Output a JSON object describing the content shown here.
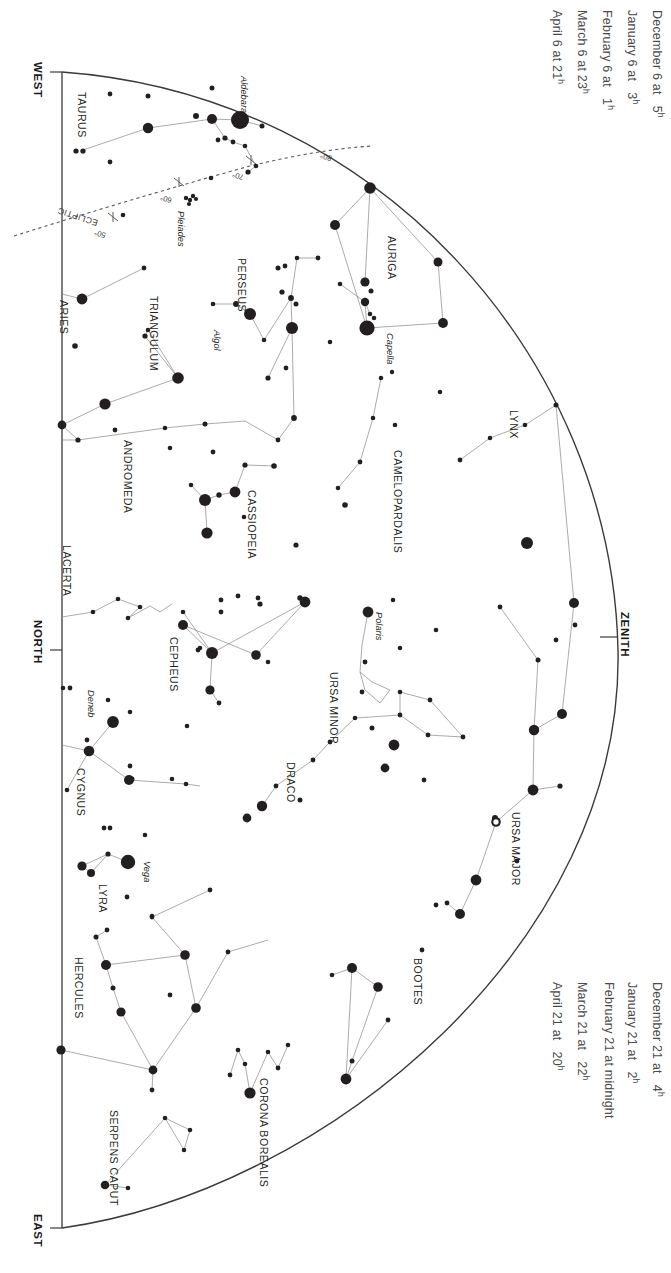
{
  "captions": {
    "top": {
      "name": "top-date-table",
      "rows": [
        {
          "date": "December 6 at",
          "time": "5",
          "unit": "h"
        },
        {
          "date": "January 6 at",
          "time": "3",
          "unit": "h"
        },
        {
          "date": "February 6 at",
          "time": "1",
          "unit": "h"
        },
        {
          "date": "March 6 at 23",
          "time": "",
          "unit": "h"
        },
        {
          "date": "April 6 at 21",
          "time": "",
          "unit": "h"
        }
      ]
    },
    "bottom": {
      "name": "bottom-date-table",
      "rows": [
        {
          "date": "December 21 at",
          "time": "4",
          "unit": "h"
        },
        {
          "date": "January 21 at",
          "time": "2",
          "unit": "h"
        },
        {
          "date": "February 21 at midnight",
          "time": "",
          "unit": ""
        },
        {
          "date": "March 21 at",
          "time": "22",
          "unit": "h"
        },
        {
          "date": "April 21 at",
          "time": "20",
          "unit": "h"
        }
      ]
    }
  },
  "directions": [
    {
      "label": "WEST",
      "x": 38,
      "y": 73
    },
    {
      "label": "NORTH",
      "x": 38,
      "y": 632
    },
    {
      "label": "EAST",
      "x": 38,
      "y": 1228
    },
    {
      "label": "ZENITH",
      "x": 631,
      "y": 624
    }
  ],
  "ecliptic": {
    "label": "ECLIPTIC",
    "degrees": [
      "50°",
      "60°",
      "70°",
      "80°"
    ]
  },
  "constellations": [
    {
      "name": "TAURUS",
      "x": 88,
      "y": 92
    },
    {
      "name": "ARIES",
      "x": 70,
      "y": 300
    },
    {
      "name": "TRIANGULUM",
      "x": 160,
      "y": 296
    },
    {
      "name": "PERSEUS",
      "x": 248,
      "y": 258
    },
    {
      "name": "ANDROMEDA",
      "x": 134,
      "y": 440
    },
    {
      "name": "CASSIOPEIA",
      "x": 258,
      "y": 490
    },
    {
      "name": "AURIGA",
      "x": 398,
      "y": 236
    },
    {
      "name": "CAMELOPARDALIS",
      "x": 404,
      "y": 450
    },
    {
      "name": "LYNX",
      "x": 520,
      "y": 410
    },
    {
      "name": "LACERTA",
      "x": 73,
      "y": 545
    },
    {
      "name": "CEPHEUS",
      "x": 180,
      "y": 637
    },
    {
      "name": "CYGNUS",
      "x": 87,
      "y": 768
    },
    {
      "name": "DRACO",
      "x": 297,
      "y": 762
    },
    {
      "name": "URSA MINOR",
      "x": 340,
      "y": 672
    },
    {
      "name": "URSA MAJOR",
      "x": 522,
      "y": 812
    },
    {
      "name": "LYRA",
      "x": 109,
      "y": 884
    },
    {
      "name": "HERCULES",
      "x": 85,
      "y": 957
    },
    {
      "name": "BOOTES",
      "x": 424,
      "y": 958
    },
    {
      "name": "CORONA BOREALIS",
      "x": 270,
      "y": 1078
    },
    {
      "name": "SERPENS CAPUT",
      "x": 120,
      "y": 1110
    }
  ],
  "named_stars": [
    {
      "name": "Aldebaran",
      "x": 249,
      "y": 76
    },
    {
      "name": "Capella",
      "x": 395,
      "y": 333
    },
    {
      "name": "Algol",
      "x": 222,
      "y": 330
    },
    {
      "name": "Polaris",
      "x": 384,
      "y": 612
    },
    {
      "name": "Deneb",
      "x": 96,
      "y": 690
    },
    {
      "name": "Vega",
      "x": 152,
      "y": 861
    },
    {
      "name": "Pleiades",
      "x": 186,
      "y": 211
    }
  ],
  "colors": {
    "ink": "#231f20",
    "caption": "#4a4a4a",
    "horizon": "#3a3a3a",
    "constellation_line": "#8a8a8a",
    "ecliptic": "#5a5a5a"
  },
  "chart_data": {
    "type": "scatter",
    "xlabel": "",
    "ylabel": "",
    "projection": "half-dome horizon with zenith at right",
    "magnitude_sizes": {
      "m1": 9,
      "m2": 6.5,
      "m3": 4.6,
      "m4": 3.2,
      "m5": 2.2
    },
    "stars": [
      {
        "x": 240,
        "y": 120,
        "r": 9.0
      },
      {
        "x": 212,
        "y": 119,
        "r": 5.0
      },
      {
        "x": 196,
        "y": 116,
        "r": 3.0
      },
      {
        "x": 110,
        "y": 94,
        "r": 2.4
      },
      {
        "x": 148,
        "y": 96,
        "r": 2.5
      },
      {
        "x": 148,
        "y": 128,
        "r": 5.2
      },
      {
        "x": 76,
        "y": 151,
        "r": 2.6
      },
      {
        "x": 83,
        "y": 151,
        "r": 2.6
      },
      {
        "x": 110,
        "y": 162,
        "r": 2.4
      },
      {
        "x": 212,
        "y": 88,
        "r": 2.5
      },
      {
        "x": 225,
        "y": 138,
        "r": 2.6
      },
      {
        "x": 218,
        "y": 140,
        "r": 2.4
      },
      {
        "x": 233,
        "y": 142,
        "r": 2.4
      },
      {
        "x": 245,
        "y": 146,
        "r": 2.3
      },
      {
        "x": 262,
        "y": 126,
        "r": 2.5
      },
      {
        "x": 256,
        "y": 166,
        "r": 2.3
      },
      {
        "x": 248,
        "y": 172,
        "r": 2.6
      },
      {
        "x": 211,
        "y": 178,
        "r": 2.3
      },
      {
        "x": 123,
        "y": 215,
        "r": 2.3
      },
      {
        "x": 186,
        "y": 198,
        "r": 2.2
      },
      {
        "x": 190,
        "y": 200,
        "r": 2.2
      },
      {
        "x": 193,
        "y": 196,
        "r": 2.2
      },
      {
        "x": 196,
        "y": 199,
        "r": 2.1
      },
      {
        "x": 189,
        "y": 204,
        "r": 2.1
      },
      {
        "x": 144,
        "y": 268,
        "r": 2.4
      },
      {
        "x": 82,
        "y": 299,
        "r": 5.4
      },
      {
        "x": 75,
        "y": 346,
        "r": 2.8
      },
      {
        "x": 145,
        "y": 336,
        "r": 2.6
      },
      {
        "x": 148,
        "y": 330,
        "r": 2.3
      },
      {
        "x": 178,
        "y": 378,
        "r": 5.8
      },
      {
        "x": 105,
        "y": 404,
        "r": 5.6
      },
      {
        "x": 62,
        "y": 425,
        "r": 4.4
      },
      {
        "x": 78,
        "y": 440,
        "r": 2.6
      },
      {
        "x": 115,
        "y": 430,
        "r": 2.4
      },
      {
        "x": 165,
        "y": 428,
        "r": 2.3
      },
      {
        "x": 205,
        "y": 424,
        "r": 2.5
      },
      {
        "x": 170,
        "y": 448,
        "r": 2.3
      },
      {
        "x": 205,
        "y": 500,
        "r": 6.0
      },
      {
        "x": 219,
        "y": 495,
        "r": 2.7
      },
      {
        "x": 235,
        "y": 492,
        "r": 5.4
      },
      {
        "x": 245,
        "y": 465,
        "r": 2.6
      },
      {
        "x": 274,
        "y": 466,
        "r": 2.8
      },
      {
        "x": 207,
        "y": 533,
        "r": 5.6
      },
      {
        "x": 191,
        "y": 485,
        "r": 2.3
      },
      {
        "x": 244,
        "y": 517,
        "r": 2.3
      },
      {
        "x": 213,
        "y": 452,
        "r": 2.4
      },
      {
        "x": 250,
        "y": 314,
        "r": 6.0
      },
      {
        "x": 236,
        "y": 304,
        "r": 2.9
      },
      {
        "x": 213,
        "y": 304,
        "r": 2.3
      },
      {
        "x": 264,
        "y": 340,
        "r": 2.3
      },
      {
        "x": 278,
        "y": 268,
        "r": 2.5
      },
      {
        "x": 282,
        "y": 292,
        "r": 2.6
      },
      {
        "x": 285,
        "y": 266,
        "r": 2.4
      },
      {
        "x": 291,
        "y": 298,
        "r": 2.9
      },
      {
        "x": 296,
        "y": 304,
        "r": 2.5
      },
      {
        "x": 292,
        "y": 328,
        "r": 6.0
      },
      {
        "x": 297,
        "y": 258,
        "r": 2.3
      },
      {
        "x": 268,
        "y": 378,
        "r": 2.6
      },
      {
        "x": 286,
        "y": 368,
        "r": 2.4
      },
      {
        "x": 294,
        "y": 418,
        "r": 2.9
      },
      {
        "x": 278,
        "y": 440,
        "r": 2.4
      },
      {
        "x": 330,
        "y": 342,
        "r": 2.3
      },
      {
        "x": 318,
        "y": 258,
        "r": 2.4
      },
      {
        "x": 370,
        "y": 188,
        "r": 5.8
      },
      {
        "x": 335,
        "y": 225,
        "r": 5.0
      },
      {
        "x": 365,
        "y": 282,
        "r": 4.6
      },
      {
        "x": 370,
        "y": 314,
        "r": 2.3
      },
      {
        "x": 374,
        "y": 318,
        "r": 2.3
      },
      {
        "x": 367,
        "y": 328,
        "r": 7.6
      },
      {
        "x": 438,
        "y": 262,
        "r": 4.5
      },
      {
        "x": 443,
        "y": 323,
        "r": 4.9
      },
      {
        "x": 371,
        "y": 291,
        "r": 2.5
      },
      {
        "x": 365,
        "y": 302,
        "r": 4.2
      },
      {
        "x": 340,
        "y": 284,
        "r": 2.3
      },
      {
        "x": 381,
        "y": 378,
        "r": 2.3
      },
      {
        "x": 440,
        "y": 392,
        "r": 2.3
      },
      {
        "x": 392,
        "y": 372,
        "r": 2.2
      },
      {
        "x": 345,
        "y": 505,
        "r": 2.8
      },
      {
        "x": 373,
        "y": 418,
        "r": 2.3
      },
      {
        "x": 395,
        "y": 425,
        "r": 2.3
      },
      {
        "x": 360,
        "y": 462,
        "r": 2.4
      },
      {
        "x": 338,
        "y": 488,
        "r": 2.3
      },
      {
        "x": 490,
        "y": 438,
        "r": 2.3
      },
      {
        "x": 460,
        "y": 460,
        "r": 2.4
      },
      {
        "x": 525,
        "y": 425,
        "r": 2.3
      },
      {
        "x": 556,
        "y": 405,
        "r": 2.5
      },
      {
        "x": 527,
        "y": 543,
        "r": 6.0
      },
      {
        "x": 296,
        "y": 545,
        "r": 2.6
      },
      {
        "x": 300,
        "y": 598,
        "r": 2.7
      },
      {
        "x": 260,
        "y": 604,
        "r": 2.6
      },
      {
        "x": 221,
        "y": 600,
        "r": 2.4
      },
      {
        "x": 238,
        "y": 596,
        "r": 2.4
      },
      {
        "x": 258,
        "y": 598,
        "r": 2.4
      },
      {
        "x": 140,
        "y": 607,
        "r": 2.3
      },
      {
        "x": 128,
        "y": 618,
        "r": 2.3
      },
      {
        "x": 93,
        "y": 612,
        "r": 2.3
      },
      {
        "x": 118,
        "y": 599,
        "r": 2.3
      },
      {
        "x": 183,
        "y": 625,
        "r": 5.0
      },
      {
        "x": 212,
        "y": 653,
        "r": 6.0
      },
      {
        "x": 210,
        "y": 690,
        "r": 4.6
      },
      {
        "x": 219,
        "y": 703,
        "r": 2.4
      },
      {
        "x": 221,
        "y": 612,
        "r": 2.4
      },
      {
        "x": 183,
        "y": 612,
        "r": 2.3
      },
      {
        "x": 198,
        "y": 650,
        "r": 2.4
      },
      {
        "x": 200,
        "y": 648,
        "r": 2.3
      },
      {
        "x": 256,
        "y": 655,
        "r": 4.8
      },
      {
        "x": 305,
        "y": 602,
        "r": 5.4
      },
      {
        "x": 187,
        "y": 726,
        "r": 2.3
      },
      {
        "x": 130,
        "y": 712,
        "r": 2.3
      },
      {
        "x": 108,
        "y": 700,
        "r": 2.3
      },
      {
        "x": 114,
        "y": 722,
        "r": 2.3
      },
      {
        "x": 87,
        "y": 740,
        "r": 2.4
      },
      {
        "x": 63,
        "y": 688,
        "r": 2.3
      },
      {
        "x": 70,
        "y": 688,
        "r": 2.4
      },
      {
        "x": 113,
        "y": 722,
        "r": 5.9
      },
      {
        "x": 89,
        "y": 751,
        "r": 5.3
      },
      {
        "x": 132,
        "y": 779,
        "r": 2.5
      },
      {
        "x": 130,
        "y": 766,
        "r": 2.4
      },
      {
        "x": 129,
        "y": 780,
        "r": 5.0
      },
      {
        "x": 172,
        "y": 779,
        "r": 2.3
      },
      {
        "x": 186,
        "y": 784,
        "r": 2.3
      },
      {
        "x": 67,
        "y": 790,
        "r": 2.3
      },
      {
        "x": 104,
        "y": 828,
        "r": 2.4
      },
      {
        "x": 110,
        "y": 828,
        "r": 2.4
      },
      {
        "x": 145,
        "y": 835,
        "r": 2.3
      },
      {
        "x": 128,
        "y": 862,
        "r": 7.2
      },
      {
        "x": 82,
        "y": 866,
        "r": 4.6
      },
      {
        "x": 91,
        "y": 873,
        "r": 4.0
      },
      {
        "x": 108,
        "y": 854,
        "r": 2.6
      },
      {
        "x": 127,
        "y": 897,
        "r": 2.4
      },
      {
        "x": 106,
        "y": 965,
        "r": 5.0
      },
      {
        "x": 96,
        "y": 937,
        "r": 2.5
      },
      {
        "x": 107,
        "y": 930,
        "r": 2.4
      },
      {
        "x": 113,
        "y": 988,
        "r": 2.5
      },
      {
        "x": 121,
        "y": 1012,
        "r": 4.6
      },
      {
        "x": 61,
        "y": 1050,
        "r": 4.6
      },
      {
        "x": 153,
        "y": 1070,
        "r": 4.4
      },
      {
        "x": 152,
        "y": 1090,
        "r": 2.4
      },
      {
        "x": 185,
        "y": 955,
        "r": 4.8
      },
      {
        "x": 152,
        "y": 917,
        "r": 2.4
      },
      {
        "x": 196,
        "y": 1008,
        "r": 4.8
      },
      {
        "x": 170,
        "y": 995,
        "r": 2.4
      },
      {
        "x": 210,
        "y": 890,
        "r": 2.4
      },
      {
        "x": 152,
        "y": 916,
        "r": 2.3
      },
      {
        "x": 228,
        "y": 952,
        "r": 2.4
      },
      {
        "x": 238,
        "y": 1050,
        "r": 2.3
      },
      {
        "x": 245,
        "y": 1064,
        "r": 2.3
      },
      {
        "x": 230,
        "y": 1075,
        "r": 2.4
      },
      {
        "x": 250,
        "y": 1093,
        "r": 5.6
      },
      {
        "x": 268,
        "y": 1052,
        "r": 2.3
      },
      {
        "x": 278,
        "y": 1068,
        "r": 2.4
      },
      {
        "x": 288,
        "y": 1045,
        "r": 2.3
      },
      {
        "x": 165,
        "y": 1118,
        "r": 2.3
      },
      {
        "x": 190,
        "y": 1130,
        "r": 2.3
      },
      {
        "x": 184,
        "y": 1150,
        "r": 2.3
      },
      {
        "x": 128,
        "y": 1188,
        "r": 2.3
      },
      {
        "x": 105,
        "y": 1185,
        "r": 4.3
      },
      {
        "x": 352,
        "y": 1061,
        "r": 2.5
      },
      {
        "x": 388,
        "y": 1020,
        "r": 2.4
      },
      {
        "x": 346,
        "y": 1079,
        "r": 5.4
      },
      {
        "x": 332,
        "y": 975,
        "r": 2.3
      },
      {
        "x": 352,
        "y": 968,
        "r": 5.0
      },
      {
        "x": 378,
        "y": 987,
        "r": 4.8
      },
      {
        "x": 436,
        "y": 905,
        "r": 2.4
      },
      {
        "x": 447,
        "y": 903,
        "r": 2.4
      },
      {
        "x": 460,
        "y": 914,
        "r": 5.0
      },
      {
        "x": 422,
        "y": 950,
        "r": 2.4
      },
      {
        "x": 476,
        "y": 880,
        "r": 5.4
      },
      {
        "x": 517,
        "y": 861,
        "r": 2.4
      },
      {
        "x": 496,
        "y": 822,
        "r": 4.8
      },
      {
        "x": 495,
        "y": 818,
        "r": 3.0
      },
      {
        "x": 533,
        "y": 790,
        "r": 5.4
      },
      {
        "x": 560,
        "y": 786,
        "r": 2.6
      },
      {
        "x": 534,
        "y": 730,
        "r": 5.2
      },
      {
        "x": 562,
        "y": 714,
        "r": 5.0
      },
      {
        "x": 538,
        "y": 660,
        "r": 2.5
      },
      {
        "x": 556,
        "y": 640,
        "r": 2.4
      },
      {
        "x": 575,
        "y": 625,
        "r": 2.4
      },
      {
        "x": 500,
        "y": 607,
        "r": 2.4
      },
      {
        "x": 574,
        "y": 603,
        "r": 5.0
      },
      {
        "x": 430,
        "y": 700,
        "r": 2.4
      },
      {
        "x": 463,
        "y": 737,
        "r": 2.4
      },
      {
        "x": 428,
        "y": 735,
        "r": 2.4
      },
      {
        "x": 400,
        "y": 715,
        "r": 2.4
      },
      {
        "x": 355,
        "y": 718,
        "r": 2.3
      },
      {
        "x": 330,
        "y": 742,
        "r": 2.4
      },
      {
        "x": 313,
        "y": 760,
        "r": 2.4
      },
      {
        "x": 276,
        "y": 786,
        "r": 2.4
      },
      {
        "x": 262,
        "y": 806,
        "r": 5.2
      },
      {
        "x": 247,
        "y": 818,
        "r": 4.4
      },
      {
        "x": 300,
        "y": 800,
        "r": 2.5
      },
      {
        "x": 436,
        "y": 630,
        "r": 2.3
      },
      {
        "x": 424,
        "y": 780,
        "r": 2.4
      },
      {
        "x": 268,
        "y": 662,
        "r": 2.3
      },
      {
        "x": 400,
        "y": 648,
        "r": 2.3
      },
      {
        "x": 393,
        "y": 600,
        "r": 2.3
      },
      {
        "x": 368,
        "y": 612,
        "r": 5.4
      },
      {
        "x": 365,
        "y": 662,
        "r": 2.4
      },
      {
        "x": 362,
        "y": 692,
        "r": 2.4
      },
      {
        "x": 372,
        "y": 728,
        "r": 2.5
      },
      {
        "x": 394,
        "y": 745,
        "r": 5.4
      },
      {
        "x": 385,
        "y": 768,
        "r": 4.4
      },
      {
        "x": 400,
        "y": 692,
        "r": 2.3
      }
    ]
  }
}
